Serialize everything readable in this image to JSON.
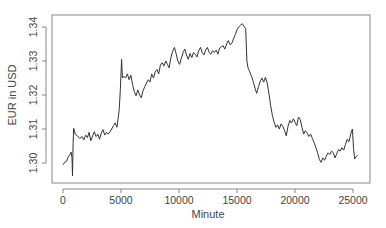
{
  "chart_data": {
    "type": "line",
    "title": "",
    "xlabel": "Minute",
    "ylabel": "EUR in USD",
    "xlim": [
      -1000,
      26500
    ],
    "ylim": [
      1.2945,
      1.3425
    ],
    "x_ticks": [
      0,
      5000,
      10000,
      15000,
      20000,
      25000
    ],
    "x_tick_labels": [
      "0",
      "5000",
      "10000",
      "15000",
      "20000",
      "25000"
    ],
    "y_ticks": [
      1.3,
      1.31,
      1.32,
      1.33,
      1.34
    ],
    "y_tick_labels": [
      "1.30",
      "1.31",
      "1.32",
      "1.33",
      "1.34"
    ],
    "grid": false,
    "legend": null,
    "line_color": "#333333",
    "series": [
      {
        "name": "EUR/USD",
        "points": [
          [
            0,
            1.2995
          ],
          [
            150,
            1.3002
          ],
          [
            300,
            1.3005
          ],
          [
            450,
            1.3018
          ],
          [
            600,
            1.3025
          ],
          [
            700,
            1.3032
          ],
          [
            780,
            1.3015
          ],
          [
            820,
            1.2962
          ],
          [
            870,
            1.3058
          ],
          [
            920,
            1.3102
          ],
          [
            1050,
            1.3085
          ],
          [
            1250,
            1.308
          ],
          [
            1450,
            1.3072
          ],
          [
            1650,
            1.3078
          ],
          [
            1800,
            1.3068
          ],
          [
            1950,
            1.3082
          ],
          [
            2100,
            1.3075
          ],
          [
            2250,
            1.309
          ],
          [
            2400,
            1.3065
          ],
          [
            2550,
            1.308
          ],
          [
            2700,
            1.3092
          ],
          [
            2850,
            1.3078
          ],
          [
            3000,
            1.3085
          ],
          [
            3150,
            1.307
          ],
          [
            3300,
            1.3088
          ],
          [
            3450,
            1.3098
          ],
          [
            3600,
            1.3082
          ],
          [
            3750,
            1.309
          ],
          [
            3900,
            1.3085
          ],
          [
            4050,
            1.3092
          ],
          [
            4200,
            1.31
          ],
          [
            4350,
            1.311
          ],
          [
            4500,
            1.3118
          ],
          [
            4650,
            1.3105
          ],
          [
            4750,
            1.313
          ],
          [
            4850,
            1.316
          ],
          [
            4950,
            1.322
          ],
          [
            5050,
            1.3305
          ],
          [
            5120,
            1.325
          ],
          [
            5250,
            1.3255
          ],
          [
            5400,
            1.325
          ],
          [
            5550,
            1.3262
          ],
          [
            5700,
            1.3245
          ],
          [
            5850,
            1.3258
          ],
          [
            6000,
            1.323
          ],
          [
            6150,
            1.321
          ],
          [
            6300,
            1.3198
          ],
          [
            6450,
            1.3215
          ],
          [
            6600,
            1.32
          ],
          [
            6750,
            1.3192
          ],
          [
            6900,
            1.3212
          ],
          [
            7050,
            1.3225
          ],
          [
            7200,
            1.3235
          ],
          [
            7350,
            1.3245
          ],
          [
            7500,
            1.3238
          ],
          [
            7650,
            1.3262
          ],
          [
            7800,
            1.325
          ],
          [
            7950,
            1.3268
          ],
          [
            8100,
            1.3275
          ],
          [
            8250,
            1.3262
          ],
          [
            8400,
            1.3288
          ],
          [
            8550,
            1.3295
          ],
          [
            8700,
            1.3285
          ],
          [
            8850,
            1.33
          ],
          [
            9000,
            1.329
          ],
          [
            9150,
            1.328
          ],
          [
            9300,
            1.331
          ],
          [
            9450,
            1.3328
          ],
          [
            9600,
            1.334
          ],
          [
            9750,
            1.3322
          ],
          [
            9900,
            1.33
          ],
          [
            10050,
            1.329
          ],
          [
            10200,
            1.3308
          ],
          [
            10350,
            1.3325
          ],
          [
            10500,
            1.3335
          ],
          [
            10650,
            1.3318
          ],
          [
            10800,
            1.3305
          ],
          [
            10950,
            1.3322
          ],
          [
            11100,
            1.331
          ],
          [
            11250,
            1.3325
          ],
          [
            11400,
            1.332
          ],
          [
            11550,
            1.3312
          ],
          [
            11700,
            1.333
          ],
          [
            11850,
            1.334
          ],
          [
            12000,
            1.3325
          ],
          [
            12150,
            1.3318
          ],
          [
            12300,
            1.3332
          ],
          [
            12450,
            1.334
          ],
          [
            12600,
            1.3325
          ],
          [
            12750,
            1.332
          ],
          [
            12900,
            1.333
          ],
          [
            13050,
            1.3325
          ],
          [
            13200,
            1.3332
          ],
          [
            13350,
            1.332
          ],
          [
            13500,
            1.3338
          ],
          [
            13650,
            1.3342
          ],
          [
            13800,
            1.3345
          ],
          [
            13950,
            1.3335
          ],
          [
            14100,
            1.335
          ],
          [
            14250,
            1.336
          ],
          [
            14400,
            1.3348
          ],
          [
            14550,
            1.3352
          ],
          [
            14700,
            1.3365
          ],
          [
            14850,
            1.3378
          ],
          [
            15000,
            1.3392
          ],
          [
            15150,
            1.34
          ],
          [
            15300,
            1.3405
          ],
          [
            15450,
            1.341
          ],
          [
            15600,
            1.3402
          ],
          [
            15750,
            1.3395
          ],
          [
            15850,
            1.33
          ],
          [
            15950,
            1.328
          ],
          [
            16100,
            1.3268
          ],
          [
            16250,
            1.3255
          ],
          [
            16400,
            1.324
          ],
          [
            16550,
            1.322
          ],
          [
            16700,
            1.3205
          ],
          [
            16850,
            1.3225
          ],
          [
            17000,
            1.324
          ],
          [
            17150,
            1.325
          ],
          [
            17300,
            1.3238
          ],
          [
            17450,
            1.3252
          ],
          [
            17600,
            1.3235
          ],
          [
            17750,
            1.3205
          ],
          [
            17900,
            1.317
          ],
          [
            18050,
            1.314
          ],
          [
            18200,
            1.312
          ],
          [
            18350,
            1.3105
          ],
          [
            18500,
            1.3112
          ],
          [
            18650,
            1.31
          ],
          [
            18800,
            1.3115
          ],
          [
            18950,
            1.3108
          ],
          [
            19100,
            1.3095
          ],
          [
            19250,
            1.308
          ],
          [
            19400,
            1.3108
          ],
          [
            19550,
            1.3125
          ],
          [
            19700,
            1.3118
          ],
          [
            19850,
            1.313
          ],
          [
            20000,
            1.312
          ],
          [
            20150,
            1.311
          ],
          [
            20300,
            1.3135
          ],
          [
            20450,
            1.3128
          ],
          [
            20600,
            1.3105
          ],
          [
            20750,
            1.3085
          ],
          [
            20900,
            1.3095
          ],
          [
            21050,
            1.3088
          ],
          [
            21200,
            1.3078
          ],
          [
            21350,
            1.3085
          ],
          [
            21500,
            1.3072
          ],
          [
            21650,
            1.306
          ],
          [
            21800,
            1.3045
          ],
          [
            21950,
            1.303
          ],
          [
            22100,
            1.301
          ],
          [
            22250,
            1.3002
          ],
          [
            22400,
            1.3015
          ],
          [
            22550,
            1.3008
          ],
          [
            22700,
            1.302
          ],
          [
            22850,
            1.303
          ],
          [
            23000,
            1.3025
          ],
          [
            23150,
            1.3035
          ],
          [
            23300,
            1.303
          ],
          [
            23450,
            1.3015
          ],
          [
            23600,
            1.3028
          ],
          [
            23750,
            1.304
          ],
          [
            23900,
            1.3035
          ],
          [
            24050,
            1.3045
          ],
          [
            24200,
            1.3038
          ],
          [
            24350,
            1.3055
          ],
          [
            24500,
            1.307
          ],
          [
            24650,
            1.3062
          ],
          [
            24800,
            1.3085
          ],
          [
            24950,
            1.31
          ],
          [
            25050,
            1.304
          ],
          [
            25150,
            1.3012
          ],
          [
            25250,
            1.3018
          ],
          [
            25400,
            1.3022
          ]
        ]
      }
    ]
  }
}
